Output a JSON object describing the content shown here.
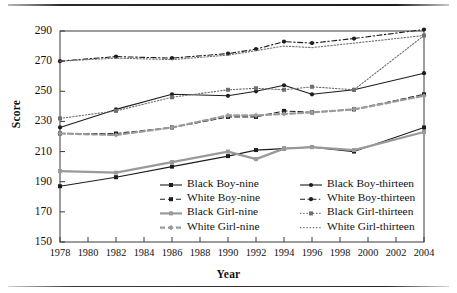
{
  "chart_data": {
    "type": "line",
    "title": "",
    "xlabel": "Year",
    "ylabel": "Score",
    "xlim": [
      1978,
      2004
    ],
    "ylim": [
      150,
      290
    ],
    "xticks": [
      1978,
      1980,
      1982,
      1984,
      1986,
      1988,
      1990,
      1992,
      1994,
      1996,
      1998,
      2000,
      2002,
      2004
    ],
    "yticks": [
      150,
      170,
      190,
      210,
      230,
      250,
      270,
      290
    ],
    "grid": false,
    "legend_position": "inside-lower-center",
    "x": [
      1978,
      1982,
      1986,
      1990,
      1992,
      1994,
      1996,
      1999,
      2004
    ],
    "series": [
      {
        "name": "Black Boy-nine",
        "values": [
          187,
          193,
          200,
          207,
          211,
          212,
          213,
          210,
          226
        ],
        "color": "#1d1d1d",
        "style": "solid",
        "marker": "square"
      },
      {
        "name": "White Boy-nine",
        "values": [
          222,
          222,
          226,
          233,
          233,
          237,
          236,
          238,
          248
        ],
        "color": "#1d1d1d",
        "style": "dashed",
        "marker": "square"
      },
      {
        "name": "Black Girl-nine",
        "values": [
          197,
          196,
          203,
          210,
          205,
          212,
          213,
          211,
          223
        ],
        "color": "#9a9a9a",
        "style": "solid",
        "marker": "square"
      },
      {
        "name": "White Girl-nine",
        "values": [
          222,
          221,
          226,
          234,
          234,
          235,
          236,
          238,
          247
        ],
        "color": "#9a9a9a",
        "style": "dashed",
        "marker": "diamond"
      },
      {
        "name": "Black Boy-thirteen",
        "values": [
          226,
          238,
          248,
          247,
          250,
          254,
          248,
          251,
          262
        ],
        "color": "#1d1d1d",
        "style": "solid",
        "marker": "circle"
      },
      {
        "name": "White Boy-thirteen",
        "values": [
          270,
          273,
          272,
          275,
          278,
          283,
          282,
          285,
          291
        ],
        "color": "#1d1d1d",
        "style": "dash-dot",
        "marker": "circle"
      },
      {
        "name": "Black Girl-thirteen",
        "values": [
          232,
          237,
          246,
          251,
          252,
          251,
          253,
          251,
          287
        ],
        "color": "#6f6f6f",
        "style": "dotted",
        "marker": "square"
      },
      {
        "name": "White Girl-thirteen",
        "values": [
          270,
          272,
          271,
          274,
          277,
          280,
          279,
          282,
          287
        ],
        "color": "#6f6f6f",
        "style": "dotted",
        "marker": "none"
      }
    ]
  },
  "axes": {
    "y_title": "Score",
    "x_title": "Year",
    "y_tick_labels": [
      "290",
      "270",
      "250",
      "230",
      "210",
      "190",
      "170",
      "150"
    ],
    "x_tick_labels": [
      "1978",
      "1980",
      "1982",
      "1984",
      "1986",
      "1988",
      "1990",
      "1992",
      "1994",
      "1996",
      "1998",
      "2000",
      "2002",
      "2004"
    ]
  },
  "legend": {
    "entries": [
      {
        "label": "Black Boy-nine",
        "col": 0,
        "row": 0
      },
      {
        "label": "White Boy-nine",
        "col": 0,
        "row": 1
      },
      {
        "label": "Black Girl-nine",
        "col": 0,
        "row": 2
      },
      {
        "label": "White Girl-nine",
        "col": 0,
        "row": 3
      },
      {
        "label": "Black Boy-thirteen",
        "col": 1,
        "row": 0
      },
      {
        "label": "White Boy-thirteen",
        "col": 1,
        "row": 1
      },
      {
        "label": "Black Girl-thirteen",
        "col": 1,
        "row": 2
      },
      {
        "label": "White Girl-thirteen",
        "col": 1,
        "row": 3
      }
    ]
  },
  "colors": {
    "dark": "#1d1d1d",
    "mid": "#6f6f6f",
    "light": "#9a9a9a",
    "frame": "#3a3a3a",
    "background": "#ffffff"
  }
}
